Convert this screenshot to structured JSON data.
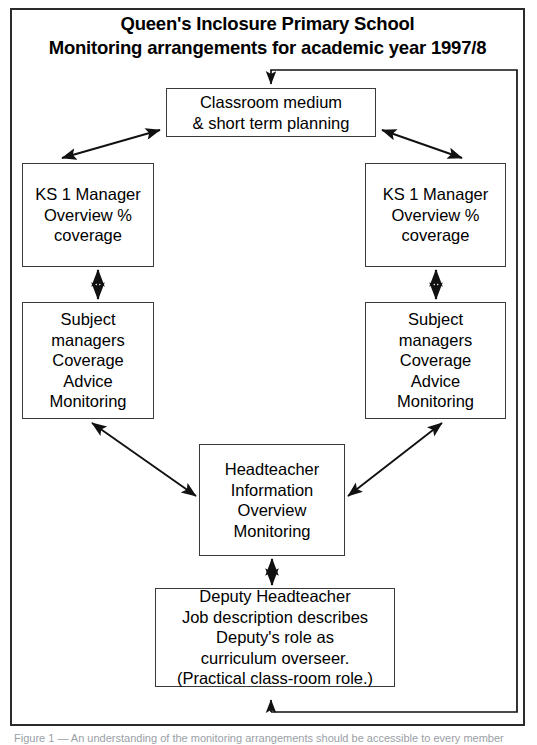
{
  "document": {
    "title_line_1": "Queen's Inclosure Primary School",
    "title_line_2": "Monitoring arrangements for academic year 1997/8",
    "caption": "Figure 1 — An understanding of the monitoring arrangements should be accessible to every member",
    "frame_color": "#2b2b2b",
    "box_border_color": "#3a3a3a",
    "line_color": "#111111",
    "background": "#ffffff"
  },
  "nodes": {
    "classroom": {
      "name": "Classroom medium & short term planning",
      "lines": [
        "Classroom medium",
        "& short term planning"
      ]
    },
    "ks1_left": {
      "name": "KS 1 Manager (left)",
      "lines": [
        "KS 1 Manager",
        "Overview %",
        "coverage"
      ]
    },
    "ks1_right": {
      "name": "KS 1 Manager (right)",
      "lines": [
        "KS 1 Manager",
        "Overview %",
        "coverage"
      ]
    },
    "subject_left": {
      "name": "Subject managers (left)",
      "lines": [
        "Subject",
        "managers",
        "Coverage",
        "Advice",
        "Monitoring"
      ]
    },
    "subject_right": {
      "name": "Subject managers (right)",
      "lines": [
        "Subject",
        "managers",
        "Coverage",
        "Advice",
        "Monitoring"
      ]
    },
    "headteacher": {
      "name": "Headteacher",
      "lines": [
        "Headteacher",
        "Information",
        "Overview",
        "Monitoring"
      ]
    },
    "deputy": {
      "name": "Deputy Headteacher",
      "lines": [
        "Deputy Headteacher",
        "Job description describes",
        "Deputy's role as",
        "curriculum overseer.",
        "(Practical class-room role.)"
      ]
    }
  },
  "connectors": [
    {
      "id": "feedback-loop",
      "from": "deputy",
      "to": "classroom",
      "style": "single-arrow",
      "path": "loop-right"
    },
    {
      "id": "classroom-to-ks1-left",
      "from": "classroom",
      "to": "ks1_left",
      "style": "double-arrow"
    },
    {
      "id": "classroom-to-ks1-right",
      "from": "classroom",
      "to": "ks1_right",
      "style": "double-arrow"
    },
    {
      "id": "ks1-left-to-subject-left",
      "from": "ks1_left",
      "to": "subject_left",
      "style": "double-arrow"
    },
    {
      "id": "ks1-right-to-subject-right",
      "from": "ks1_right",
      "to": "subject_right",
      "style": "double-arrow"
    },
    {
      "id": "subject-left-to-headteacher",
      "from": "subject_left",
      "to": "headteacher",
      "style": "double-arrow"
    },
    {
      "id": "subject-right-to-headteacher",
      "from": "subject_right",
      "to": "headteacher",
      "style": "double-arrow"
    },
    {
      "id": "headteacher-to-deputy",
      "from": "headteacher",
      "to": "deputy",
      "style": "double-arrow"
    }
  ]
}
